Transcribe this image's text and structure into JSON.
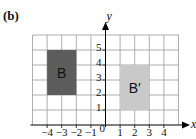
{
  "figure": {
    "label": "(b)",
    "x_axis_label": "x",
    "y_axis_label": "y",
    "origin_label": "0",
    "x_tick_labels": [
      {
        "value": -4,
        "text": "−4"
      },
      {
        "value": -3,
        "text": "−3"
      },
      {
        "value": -2,
        "text": "−2"
      },
      {
        "value": -1,
        "text": "−1"
      },
      {
        "value": 1,
        "text": "1"
      },
      {
        "value": 2,
        "text": "2"
      },
      {
        "value": 3,
        "text": "3"
      },
      {
        "value": 4,
        "text": "4"
      }
    ],
    "y_tick_labels": [
      {
        "value": 1,
        "text": "1"
      },
      {
        "value": 2,
        "text": "2"
      },
      {
        "value": 3,
        "text": "3"
      },
      {
        "value": 4,
        "text": "4"
      },
      {
        "value": 5,
        "text": "5"
      }
    ],
    "grid": {
      "x_min": -5,
      "x_max": 5,
      "y_min": 0,
      "y_max": 6
    },
    "shapes": [
      {
        "name": "B",
        "label": "B",
        "x1": -4,
        "x2": -2,
        "y1": 2,
        "y2": 5,
        "fill": "#5c5c5c"
      },
      {
        "name": "B-prime",
        "label": "B′",
        "x1": 1,
        "x2": 3,
        "y1": 1,
        "y2": 4,
        "fill": "#c9c9c9"
      }
    ],
    "colors": {
      "grid": "#9a9a9a",
      "axis": "#000000",
      "text": "#111111"
    }
  }
}
